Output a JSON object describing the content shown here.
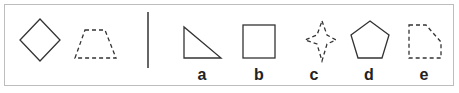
{
  "puzzle": {
    "question_shapes": [
      {
        "name": "diamond",
        "style": "solid"
      },
      {
        "name": "trapezoid",
        "style": "dashed"
      }
    ],
    "options": [
      {
        "label": "a",
        "shape": "right-triangle",
        "style": "solid"
      },
      {
        "label": "b",
        "shape": "square",
        "style": "solid"
      },
      {
        "label": "c",
        "shape": "four-pointed-star",
        "style": "dashed"
      },
      {
        "label": "d",
        "shape": "pentagon",
        "style": "solid"
      },
      {
        "label": "e",
        "shape": "cut-corner-rectangle",
        "style": "dashed"
      }
    ]
  },
  "colors": {
    "stroke": "#333333",
    "border": "#bdbdbd"
  }
}
